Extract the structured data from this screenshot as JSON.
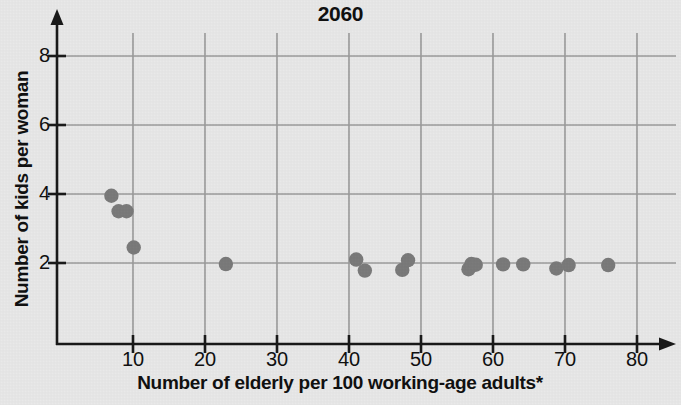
{
  "chart_data": {
    "type": "scatter",
    "title": "2060",
    "xlabel": "Number of elderly per 100 working-age adults*",
    "ylabel": "Number of kids per woman",
    "xlim": [
      0,
      83
    ],
    "ylim": [
      0,
      8.6
    ],
    "xticks": [
      10,
      20,
      30,
      40,
      50,
      60,
      70,
      80
    ],
    "yticks": [
      2,
      4,
      6,
      8
    ],
    "grid": true,
    "legend": "none",
    "marker_color": "#7b7b7b",
    "points": [
      {
        "x": 7.0,
        "y": 3.95
      },
      {
        "x": 8.0,
        "y": 3.5
      },
      {
        "x": 9.1,
        "y": 3.5
      },
      {
        "x": 10.1,
        "y": 2.45
      },
      {
        "x": 22.9,
        "y": 1.97
      },
      {
        "x": 41.0,
        "y": 2.1
      },
      {
        "x": 42.2,
        "y": 1.78
      },
      {
        "x": 47.4,
        "y": 1.8
      },
      {
        "x": 48.2,
        "y": 2.08
      },
      {
        "x": 56.6,
        "y": 1.82
      },
      {
        "x": 57.0,
        "y": 1.97
      },
      {
        "x": 57.6,
        "y": 1.95
      },
      {
        "x": 61.4,
        "y": 1.96
      },
      {
        "x": 64.2,
        "y": 1.96
      },
      {
        "x": 68.8,
        "y": 1.84
      },
      {
        "x": 70.5,
        "y": 1.94
      },
      {
        "x": 76.0,
        "y": 1.94
      }
    ]
  },
  "axes": {
    "y_tick_labels": [
      "8",
      "6",
      "4",
      "2"
    ],
    "x_tick_labels": [
      "10",
      "20",
      "30",
      "40",
      "50",
      "60",
      "70",
      "80"
    ]
  },
  "colors": {
    "background": "#e9e9e9",
    "grid": "#9a9a9a",
    "axis": "#1a1a1a",
    "marker": "#7b7b7b",
    "text": "#111111"
  }
}
